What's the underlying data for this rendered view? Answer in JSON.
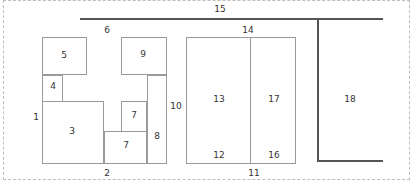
{
  "diagram": {
    "type": "floor-plan / region layout",
    "labels": {
      "l1": "1",
      "l2": "2",
      "l3": "3",
      "l4": "4",
      "l5": "5",
      "l6": "6",
      "l7a": "7",
      "l7b": "7",
      "l8": "8",
      "l9": "9",
      "l10": "10",
      "l11": "11",
      "l12": "12",
      "l13": "13",
      "l14": "14",
      "l15": "15",
      "l16": "16",
      "l17": "17",
      "l18": "18"
    },
    "regions": [
      {
        "id": "3",
        "x": 42,
        "y": 101,
        "w": 62,
        "h": 62
      },
      {
        "id": "4",
        "x": 42,
        "y": 75,
        "w": 21,
        "h": 26
      },
      {
        "id": "5",
        "x": 42,
        "y": 37,
        "w": 44,
        "h": 38
      },
      {
        "id": "9",
        "x": 121,
        "y": 37,
        "w": 46,
        "h": 38
      },
      {
        "id": "7-upper",
        "x": 121,
        "y": 101,
        "w": 26,
        "h": 30
      },
      {
        "id": "7-lower",
        "x": 104,
        "y": 131,
        "w": 43,
        "h": 32
      },
      {
        "id": "8",
        "x": 147,
        "y": 75,
        "w": 20,
        "h": 88
      },
      {
        "id": "13/12",
        "x": 186,
        "y": 37,
        "w": 65,
        "h": 126
      },
      {
        "id": "17/16",
        "x": 251,
        "y": 37,
        "w": 45,
        "h": 126
      }
    ],
    "lines": [
      {
        "id": "15",
        "from": [
          80,
          19
        ],
        "to": [
          383,
          19
        ]
      },
      {
        "id": "18-vertical",
        "from": [
          318,
          19
        ],
        "to": [
          318,
          161
        ]
      },
      {
        "id": "18-bottom",
        "from": [
          318,
          161
        ],
        "to": [
          383,
          161
        ]
      }
    ]
  }
}
